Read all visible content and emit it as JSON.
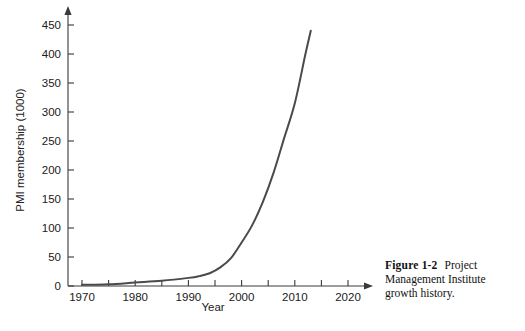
{
  "figure": {
    "label": "Figure 1-2",
    "caption": "Project Management Institute growth history."
  },
  "chart_data": {
    "type": "line",
    "title": "",
    "xlabel": "Year",
    "ylabel": "PMI membership (1000)",
    "xlim": [
      1968,
      2024
    ],
    "ylim": [
      0,
      460
    ],
    "grid": false,
    "legend": "none",
    "line_color": "#4a4a4a",
    "axis_color": "#3a3a3a",
    "x_ticks_major": [
      1970,
      1980,
      1990,
      2000,
      2010,
      2020
    ],
    "x_ticks_minor": [
      1975,
      1985,
      1995,
      2005,
      2015
    ],
    "y_ticks": [
      0,
      50,
      100,
      150,
      200,
      250,
      300,
      350,
      400,
      450
    ],
    "x": [
      1970,
      1975,
      1980,
      1985,
      1990,
      1992,
      1994,
      1996,
      1998,
      2000,
      2002,
      2004,
      2006,
      2008,
      2010,
      2012,
      2013
    ],
    "values": [
      2,
      3,
      6,
      9,
      14,
      17,
      22,
      32,
      48,
      75,
      105,
      145,
      195,
      255,
      315,
      400,
      440
    ],
    "series": [
      {
        "name": "PMI membership",
        "values": [
          2,
          3,
          6,
          9,
          14,
          17,
          22,
          32,
          48,
          75,
          105,
          145,
          195,
          255,
          315,
          400,
          440
        ]
      }
    ]
  }
}
